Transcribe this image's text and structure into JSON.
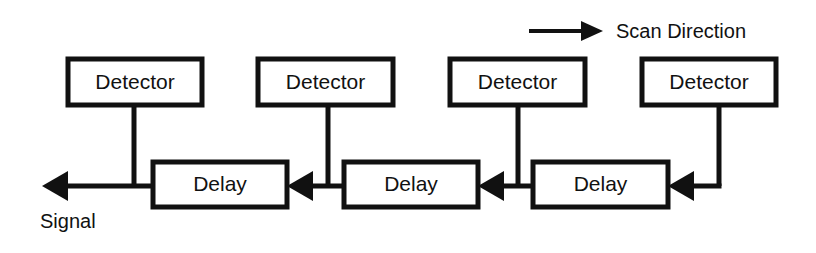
{
  "diagram": {
    "type": "block-diagram",
    "canvas": {
      "width": 816,
      "height": 253,
      "background": "#ffffff"
    },
    "line_color": "#111111",
    "legend": {
      "label": "Scan Direction",
      "arrow_direction": "right",
      "arrow": {
        "x1": 529,
        "y1": 31,
        "x2": 603,
        "y2": 31
      },
      "label_x": 616,
      "label_y": 38
    },
    "detectors": [
      {
        "id": "detector-1",
        "label": "Detector",
        "x": 68,
        "y": 59,
        "w": 134,
        "h": 46,
        "drop_x": 134
      },
      {
        "id": "detector-2",
        "label": "Detector",
        "x": 258,
        "y": 59,
        "w": 135,
        "h": 46,
        "drop_x": 328
      },
      {
        "id": "detector-3",
        "label": "Detector",
        "x": 450,
        "y": 59,
        "w": 135,
        "h": 46,
        "drop_x": 518
      },
      {
        "id": "detector-4",
        "label": "Detector",
        "x": 642,
        "y": 59,
        "w": 134,
        "h": 46,
        "drop_x": 719
      }
    ],
    "delays": [
      {
        "id": "delay-1",
        "label": "Delay",
        "x": 153,
        "y": 162,
        "w": 134,
        "h": 45
      },
      {
        "id": "delay-2",
        "label": "Delay",
        "x": 344,
        "y": 162,
        "w": 134,
        "h": 45
      },
      {
        "id": "delay-3",
        "label": "Delay",
        "x": 533,
        "y": 162,
        "w": 135,
        "h": 45
      }
    ],
    "signal_bus_y": 186,
    "output": {
      "label": "Signal",
      "arrow_tip_x": 42,
      "arrow_tail_x": 153,
      "label_x": 40,
      "label_y": 228,
      "direction": "left"
    },
    "connectors": [
      {
        "id": "link-delay2-to-delay1",
        "from_x": 344,
        "to_x": 287,
        "arrow": "left"
      },
      {
        "id": "link-delay3-to-delay2",
        "from_x": 533,
        "to_x": 478,
        "arrow": "left"
      },
      {
        "id": "link-input-to-delay3",
        "from_x": 719,
        "to_x": 668,
        "arrow": "left"
      }
    ]
  }
}
